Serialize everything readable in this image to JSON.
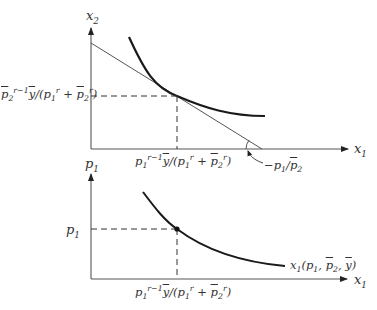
{
  "figure": {
    "top_panel": {
      "x_axis_label": "x1",
      "y_axis_label": "x2",
      "y_tick_label": "p̄2^(r−1) ȳ/(p1^r + p̄2^r)",
      "x_tick_label": "p1^(r−1) ȳ/(p1^r + p̄2^r)",
      "slope_annotation": "−p1/p̄2",
      "curves": [
        {
          "name": "indifference-curve",
          "style": "thick"
        },
        {
          "name": "budget-line",
          "style": "thin"
        }
      ]
    },
    "bottom_panel": {
      "x_axis_label": "x1",
      "y_axis_label": "p1",
      "y_tick_label": "p1",
      "x_tick_label": "p1^(r−1) ȳ/(p1^r + p̄2^r)",
      "curve_label": "x1(p1, p̄2, ȳ)",
      "curves": [
        {
          "name": "demand-curve",
          "style": "thick"
        }
      ]
    },
    "colors": {
      "ink": "#222222",
      "thin_line": "#555555",
      "text": "#333333"
    }
  },
  "text": {
    "top_y_axis": {
      "base": "x",
      "sub": "2"
    },
    "top_x_axis": {
      "base": "x",
      "sub": "1"
    },
    "top_y_tick": {
      "p": "p",
      "sub": "2",
      "sup": "r−1",
      "y": "y",
      "rest1": "/(",
      "p1": "p",
      "p1sub": "1",
      "p1sup": "r",
      "plus": " + ",
      "p2": "p",
      "p2sub": "2",
      "p2sup": "r",
      "close": ")"
    },
    "top_x_tick": {
      "p": "p",
      "sub": "1",
      "sup": "r−1",
      "y": "y",
      "rest1": "/(",
      "p1": "p",
      "p1sub": "1",
      "p1sup": "r",
      "plus": " + ",
      "p2": "p",
      "p2sub": "2",
      "p2sup": "r",
      "close": ")"
    },
    "slope": {
      "minus": "−",
      "p1": "p",
      "p1sub": "1",
      "slash": "/",
      "p2": "p",
      "p2sub": "2"
    },
    "bottom_y_axis": {
      "base": "p",
      "sub": "1"
    },
    "bottom_y_tick": {
      "base": "p",
      "sub": "1"
    },
    "bottom_x_axis": {
      "base": "x",
      "sub": "1"
    },
    "bottom_x_tick": {
      "p": "p",
      "sub": "1",
      "sup": "r−1",
      "y": "y",
      "rest1": "/(",
      "p1": "p",
      "p1sub": "1",
      "p1sup": "r",
      "plus": " + ",
      "p2": "p",
      "p2sub": "2",
      "p2sup": "r",
      "close": ")"
    },
    "demand_label": {
      "x": "x",
      "xsub": "1",
      "open": "(",
      "p1": "p",
      "p1sub": "1",
      "c1": ", ",
      "p2": "p",
      "p2sub": "2",
      "c2": ", ",
      "y": "y",
      "close": ")"
    }
  }
}
